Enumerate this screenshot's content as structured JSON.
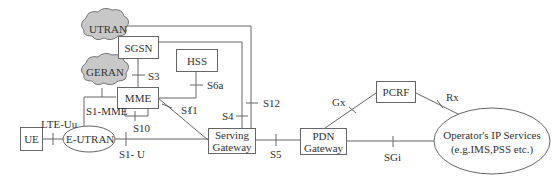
{
  "nodes": {
    "utran": "UTRAN",
    "geran": "GERAN",
    "sgsn": "SGSN",
    "hss": "HSS",
    "mme": "MME",
    "ue": "UE",
    "eutran": "E-UTRAN",
    "serving_gateway": [
      "Serving",
      "Gateway"
    ],
    "pdn_gateway": [
      "PDN",
      "Gateway"
    ],
    "pcrf": "PCRF",
    "operator_services": [
      "Operator's IP Services",
      "(e.g.IMS,PSS etc.)"
    ]
  },
  "interfaces": {
    "s3": "S3",
    "s6a": "S6a",
    "s1_mme": "S1-MME",
    "s11": "S11",
    "s10": "S10",
    "s4": "S4",
    "s12": "S12",
    "lte_uu": "LTE-Uu",
    "s1_u": "S1- U",
    "s5": "S5",
    "gx": "Gx",
    "rx": "Rx",
    "sgi": "SGi"
  },
  "colors": {
    "line": "#666666",
    "cloud_fill": "#c8c8c8",
    "text": "#333333"
  }
}
